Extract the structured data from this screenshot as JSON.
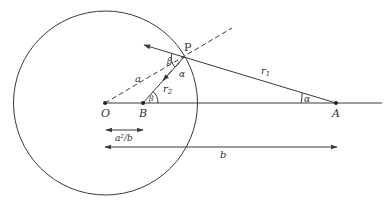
{
  "diagram": {
    "points": {
      "O": {
        "label": "O",
        "x": 105,
        "y": 103
      },
      "B": {
        "label": "B",
        "x": 143,
        "y": 103
      },
      "A": {
        "label": "A",
        "x": 336,
        "y": 103
      },
      "P": {
        "label": "P",
        "x": 184,
        "y": 57
      }
    },
    "circle": {
      "cx": 105.5,
      "cy": 103,
      "r": 92
    },
    "labels": {
      "P": "P",
      "O": "O",
      "B": "B",
      "A": "A",
      "a": "a",
      "r1": "r",
      "r1_sub": "1",
      "r2": "r",
      "r2_sub": "2",
      "beta_at_P": "β",
      "beta_at_B": "β",
      "alpha_at_P": "α",
      "alpha_at_A": "α",
      "image_distance": "a²/b",
      "b": "b"
    },
    "dimensions": [
      {
        "name": "a2-over-b",
        "label": "a²/b",
        "x1": 106,
        "x2": 143,
        "y": 130,
        "double_headed": true
      },
      {
        "name": "b",
        "label": "b",
        "x1": 105,
        "x2": 337,
        "y": 147,
        "double_headed": true
      }
    ],
    "colors": {
      "line": "#3a3a3a",
      "text": "#333333",
      "background": "#ffffff"
    }
  }
}
